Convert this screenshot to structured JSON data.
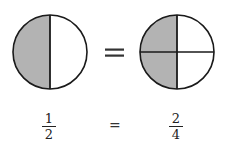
{
  "diagram": {
    "colors": {
      "shaded": "#b3b3b3",
      "stroke": "#1a1a1a",
      "background": "#ffffff"
    },
    "left_circle": {
      "parts": 2,
      "shaded": 1,
      "fraction": {
        "numerator": "1",
        "denominator": "2"
      }
    },
    "right_circle": {
      "parts": 4,
      "shaded": 2,
      "fraction": {
        "numerator": "2",
        "denominator": "4"
      }
    },
    "equals_symbol": "=",
    "equals_small": "="
  }
}
